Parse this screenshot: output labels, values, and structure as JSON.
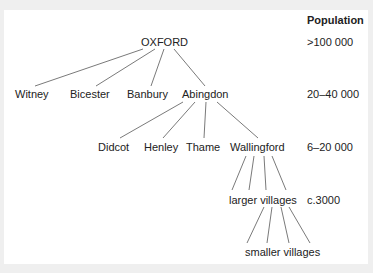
{
  "diagram": {
    "type": "hierarchy-tree",
    "column_header": "Population",
    "levels": [
      {
        "population": ">100 000",
        "nodes": [
          "OXFORD"
        ]
      },
      {
        "population": "20–40 000",
        "nodes": [
          "Witney",
          "Bicester",
          "Banbury",
          "Abingdon"
        ]
      },
      {
        "population": "6–20 000",
        "nodes": [
          "Didcot",
          "Henley",
          "Thame",
          "Wallingford"
        ]
      },
      {
        "population": "c.3000",
        "nodes": [
          "larger villages"
        ]
      },
      {
        "population": "",
        "nodes": [
          "smaller villages"
        ]
      }
    ],
    "edges": [
      {
        "from": "OXFORD",
        "to": "Witney"
      },
      {
        "from": "OXFORD",
        "to": "Bicester"
      },
      {
        "from": "OXFORD",
        "to": "Banbury"
      },
      {
        "from": "OXFORD",
        "to": "Abingdon"
      },
      {
        "from": "Abingdon",
        "to": "Didcot"
      },
      {
        "from": "Abingdon",
        "to": "Henley"
      },
      {
        "from": "Abingdon",
        "to": "Thame"
      },
      {
        "from": "Abingdon",
        "to": "Wallingford"
      },
      {
        "from": "Wallingford",
        "to": "larger villages",
        "count": 4
      },
      {
        "from": "larger villages",
        "to": "smaller villages",
        "count": 4
      }
    ],
    "colors": {
      "frame": "#efefef",
      "panel": "#ffffff",
      "text": "#222222",
      "line": "#7a7a7a"
    }
  }
}
